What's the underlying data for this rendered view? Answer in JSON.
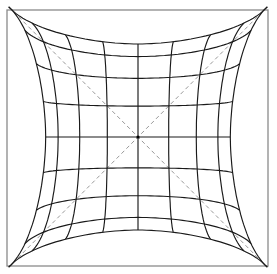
{
  "diagram": {
    "title": "",
    "grid_divisions": 8,
    "edge_curvature": 0.4,
    "show_diagonals": true,
    "colors": {
      "background": "#ffffff",
      "grid": "#1a1a1a",
      "frame": "#8a8a8a",
      "diagonals": "#8c8c8c"
    }
  }
}
